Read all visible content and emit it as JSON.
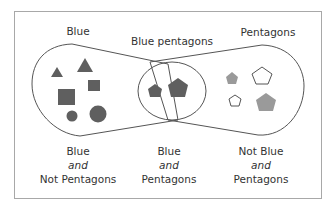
{
  "diagram": {
    "type": "venn",
    "colors": {
      "dark_fill": "#5f5f5f",
      "light_fill": "#9a9a9a",
      "outline": "#555555",
      "border": "#a8a8a8"
    },
    "set_labels": {
      "blue": "Blue",
      "intersection": "Blue pentagons",
      "pentagons": "Pentagons"
    },
    "region_captions": {
      "left": {
        "line1": "Blue",
        "line2": "and",
        "line3": "Not Pentagons"
      },
      "middle": {
        "line1": "Blue",
        "line2": "and",
        "line3": "Pentagons"
      },
      "right": {
        "line1": "Not Blue",
        "line2": "and",
        "line3": "Pentagons"
      }
    },
    "shapes": {
      "blue_only": [
        "small triangle",
        "large triangle",
        "large square",
        "small square",
        "small circle",
        "large circle"
      ],
      "blue_pentagons": [
        "small dark pentagon",
        "large dark pentagon"
      ],
      "pentagons_only": [
        "small gray pentagon",
        "large outline pentagon",
        "small outline pentagon",
        "large gray pentagon"
      ]
    }
  }
}
